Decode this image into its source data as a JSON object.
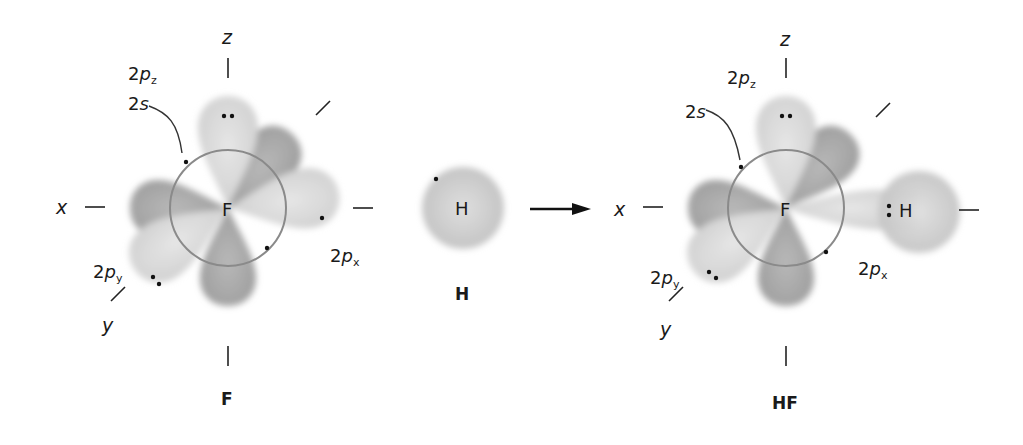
{
  "atoms": {
    "fluorine": {
      "symbol": "F",
      "caption": "F",
      "axes": {
        "x": "x",
        "y": "y",
        "z": "z"
      },
      "orbitals": {
        "s": {
          "num": "2",
          "letter": "s"
        },
        "pz": {
          "num": "2",
          "letter": "p",
          "sub": "z"
        },
        "px": {
          "num": "2",
          "letter": "p",
          "sub": "x"
        },
        "py": {
          "num": "2",
          "letter": "p",
          "sub": "y"
        }
      }
    },
    "hydrogen": {
      "symbol": "H",
      "caption": "H"
    },
    "hf": {
      "f_symbol": "F",
      "h_symbol": "H",
      "caption": "HF",
      "bond_dots": ":",
      "axes": {
        "x": "x",
        "y": "y",
        "z": "z"
      },
      "orbitals": {
        "s": {
          "num": "2",
          "letter": "s"
        },
        "pz": {
          "num": "2",
          "letter": "p",
          "sub": "z"
        },
        "px": {
          "num": "2",
          "letter": "p",
          "sub": "x"
        },
        "py": {
          "num": "2",
          "letter": "p",
          "sub": "y"
        }
      }
    }
  },
  "colors": {
    "light_lobe": "#d6d6d6",
    "dark_lobe": "#a9a9a9",
    "ring": "#8a8a8a",
    "ink": "#1a1a1a"
  },
  "reaction_arrow": "right-arrow"
}
